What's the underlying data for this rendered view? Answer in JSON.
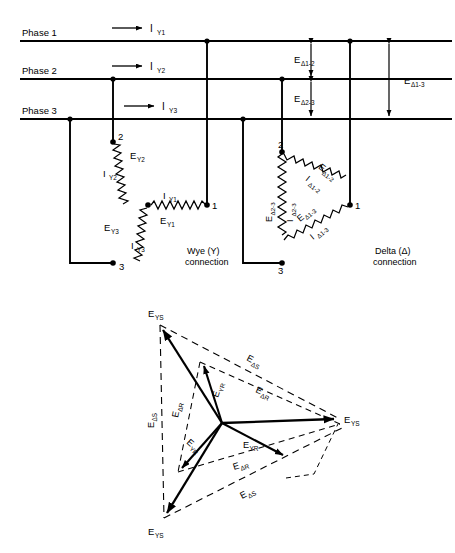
{
  "bus": {
    "phase1_label": "Phase 1",
    "phase2_label": "Phase 2",
    "phase3_label": "Phase 3"
  },
  "line_currents": {
    "iy1": "I",
    "iy1_sub": "Y1",
    "iy2": "I",
    "iy2_sub": "Y2",
    "iy3": "I",
    "iy3_sub": "Y3"
  },
  "delta_voltages": {
    "e12": "E",
    "e12_sub": "Δ1-2",
    "e23": "E",
    "e23_sub": "Δ2-3",
    "e13": "E",
    "e13_sub": "Δ1-3"
  },
  "wye": {
    "caption_line1": "Wye (Y)",
    "caption_line2": "connection",
    "node1": "1",
    "node2": "2",
    "node3": "3",
    "windings": [
      {
        "e": "E",
        "e_sub": "Y1",
        "i": "I",
        "i_sub": "Y1"
      },
      {
        "e": "E",
        "e_sub": "Y2",
        "i": "I",
        "i_sub": "Y2"
      },
      {
        "e": "E",
        "e_sub": "Y3",
        "i": "I",
        "i_sub": "Y3"
      }
    ]
  },
  "delta": {
    "caption_line1": "Delta (Δ)",
    "caption_line2": "connection",
    "node1": "1",
    "node2": "2",
    "node3": "3",
    "windings": [
      {
        "e": "E",
        "e_sub": "Δ1-2",
        "i": "I",
        "i_sub": "Δ1-2"
      },
      {
        "e": "E",
        "e_sub": "Δ2-3",
        "i": "I",
        "i_sub": "Δ2-3"
      },
      {
        "e": "E",
        "e_sub": "Δ1-3",
        "i": "I",
        "i_sub": "Δ1-3"
      }
    ]
  },
  "phasor": {
    "outer_top": {
      "e": "E",
      "sub": "YS"
    },
    "outer_right": {
      "e": "E",
      "sub": "YS"
    },
    "outer_bottom": {
      "e": "E",
      "sub": "YS"
    },
    "inner_up": {
      "e": "E",
      "sub": "YR"
    },
    "inner_right": {
      "e": "E",
      "sub": "YR"
    },
    "inner_down": {
      "e": "E",
      "sub": "YR"
    },
    "delta_left": {
      "e": "E",
      "sub": "ΔS"
    },
    "delta_upper": {
      "e": "E",
      "sub": "ΔS"
    },
    "delta_lower": {
      "e": "E",
      "sub": "ΔS"
    },
    "delta_r_upper_left": {
      "e": "E",
      "sub": "ΔR"
    },
    "delta_r_upper_right": {
      "e": "E",
      "sub": "ΔR"
    },
    "delta_r_lower": {
      "e": "E",
      "sub": "ΔR"
    }
  },
  "colors": {
    "ink": "#000000",
    "background": "#ffffff"
  }
}
